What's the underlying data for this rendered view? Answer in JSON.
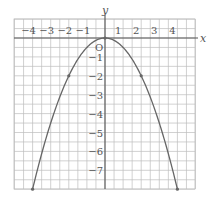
{
  "chart_data": {
    "type": "line",
    "title": "",
    "equation": "y = -x^2/2",
    "xlabel": "x",
    "ylabel": "y",
    "origin_label": "O",
    "xlim": [
      -4.5,
      4.5
    ],
    "ylim": [
      -8,
      1
    ],
    "grid": true,
    "grid_step": 0.5,
    "x_ticks": [
      -4,
      -3,
      -2,
      -1,
      1,
      2,
      3,
      4
    ],
    "x_tick_labels": [
      "−4",
      "−3",
      "−2",
      "−1",
      "1",
      "2",
      "3",
      "4"
    ],
    "y_ticks": [
      -1,
      -2,
      -3,
      -4,
      -5,
      -6,
      -7
    ],
    "y_tick_labels": [
      "−1",
      "−2",
      "−3",
      "−4",
      "−5",
      "−6",
      "−7"
    ],
    "series": [
      {
        "name": "parabola",
        "x": [
          -4,
          -3,
          -2,
          -1,
          0,
          1,
          2,
          3,
          4
        ],
        "y": [
          -8,
          -4.5,
          -2,
          -0.5,
          0,
          -0.5,
          -2,
          -4.5,
          -8
        ],
        "color": "#666666"
      }
    ],
    "marked_points": [
      {
        "x": -4,
        "y": -8
      },
      {
        "x": -2,
        "y": -2
      },
      {
        "x": 0,
        "y": 0
      },
      {
        "x": 2,
        "y": -2
      },
      {
        "x": 4,
        "y": -8
      }
    ]
  },
  "colors": {
    "grid": "#bdbdbd",
    "axis": "#555555",
    "curve": "#666666"
  }
}
